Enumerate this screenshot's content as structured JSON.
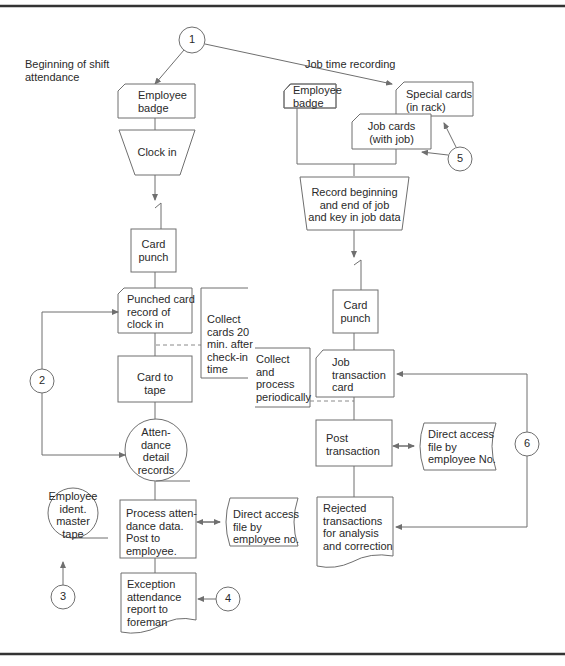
{
  "sections": {
    "attendance_title": "Beginning of shift\nattendance",
    "job_title": "Job time recording"
  },
  "connectors": [
    "1",
    "2",
    "3",
    "4",
    "5",
    "6"
  ],
  "left": {
    "badge": "Employee\nbadge",
    "clock_in": "Clock in",
    "card_punch": "Card\npunch",
    "punched_card": "Punched card\nrecord of\nclock in",
    "collect_note": "Collect\ncards 20\nmin. after\ncheck-in\ntime",
    "card_to_tape": "Card to\ntape",
    "attendance_records": "Atten-\ndance\ndetail\nrecords",
    "master_tape": "Employee\nident.\nmaster\ntape",
    "process": "Process atten-\ndance data.\nPost to\nemployee.",
    "direct_access": "Direct access\nfile by\nemployee no.",
    "exception_report": "Exception\nattendance\nreport to\nforeman"
  },
  "right": {
    "badge": "Employee\nbadge",
    "special_cards": "Special cards\n(in rack)",
    "job_cards": "Job cards\n(with job)",
    "record_job": "Record beginning\nand end of job\nand key in job data",
    "card_punch": "Card\npunch",
    "collect_note": "Collect\nand\nprocess\nperiodically",
    "job_transaction": "Job\ntransaction\ncard",
    "post_transaction": "Post\ntransaction",
    "direct_access": "Direct access\nfile by\nemployee No.",
    "rejected": "Rejected\ntransactions\nfor analysis\nand correction"
  }
}
